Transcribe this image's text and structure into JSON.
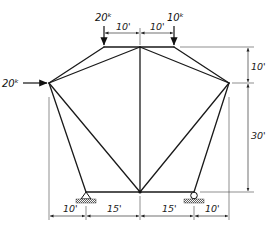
{
  "figure": {
    "type": "truss",
    "colors": {
      "line": "#1a1a1a",
      "background": "#ffffff"
    }
  },
  "loads": [
    {
      "id": "load-top-left",
      "label": "20k",
      "display": "20ᵏ",
      "direction": "down"
    },
    {
      "id": "load-top-right",
      "label": "10k",
      "display": "10ᵏ",
      "direction": "down"
    },
    {
      "id": "load-left-node",
      "label": "20k",
      "display": "20ᵏ",
      "direction": "right"
    }
  ],
  "dimensions": {
    "top": [
      "10'",
      "10'"
    ],
    "right": [
      "10'",
      "30'"
    ],
    "bottom": [
      "10'",
      "15'",
      "15'",
      "10'"
    ]
  },
  "supports": [
    {
      "id": "left-support",
      "type": "pin"
    },
    {
      "id": "right-support",
      "type": "roller"
    }
  ]
}
